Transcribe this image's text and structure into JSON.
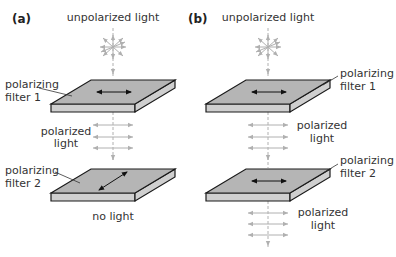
{
  "colors": {
    "filter_top": "#b5b5b5",
    "filter_side": "#cfcfcf",
    "filter_edge": "#1a1a1a",
    "light_ray": "#b0b0b0",
    "polarization_arrow": "#111111",
    "text": "#333333"
  },
  "panels": [
    {
      "id": "a",
      "label": "(a)",
      "source_label": "unpolarized light",
      "filter1": {
        "label_line1": "polarizing",
        "label_line2": "filter 1",
        "axis": "horizontal"
      },
      "middle_light": {
        "label_line1": "polarized",
        "label_line2": "light"
      },
      "filter2": {
        "label_line1": "polarizing",
        "label_line2": "filter 2",
        "axis": "diagonal"
      },
      "output_label": "no light"
    },
    {
      "id": "b",
      "label": "(b)",
      "source_label": "unpolarized light",
      "filter1": {
        "label_line1": "polarizing",
        "label_line2": "filter 1",
        "axis": "horizontal"
      },
      "middle_light": {
        "label_line1": "polarized",
        "label_line2": "light"
      },
      "filter2": {
        "label_line1": "polarizing",
        "label_line2": "filter 2",
        "axis": "horizontal"
      },
      "output_light": {
        "label_line1": "polarized",
        "label_line2": "light"
      }
    }
  ]
}
